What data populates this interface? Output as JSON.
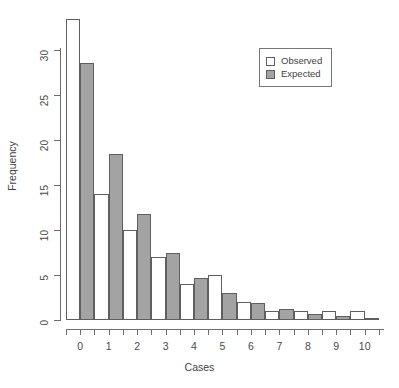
{
  "chart_data": {
    "type": "bar",
    "title": "",
    "xlabel": "Cases",
    "ylabel": "Frequency",
    "categories": [
      "0",
      "1",
      "2",
      "3",
      "4",
      "5",
      "6",
      "7",
      "8",
      "9",
      "10"
    ],
    "series": [
      {
        "name": "Observed",
        "fill": "#ffffff",
        "values": [
          33.5,
          14,
          10,
          7,
          4,
          5,
          2,
          1,
          1,
          1,
          1
        ]
      },
      {
        "name": "Expected",
        "fill": "#a3a3a3",
        "values": [
          28.6,
          18.4,
          11.8,
          7.4,
          4.7,
          3.0,
          1.9,
          1.2,
          0.7,
          0.4,
          0.2
        ]
      }
    ],
    "ylim": [
      0,
      33.5
    ],
    "yticks": [
      0,
      5,
      10,
      15,
      20,
      25,
      30
    ],
    "ytick_labels": [
      "0",
      "5",
      "10",
      "15",
      "20",
      "25",
      "30"
    ],
    "xticks": [
      "0",
      "1",
      "2",
      "3",
      "4",
      "5",
      "6",
      "7",
      "8",
      "9",
      "10"
    ],
    "grid": false,
    "legend_position": "top-right",
    "legend_entries": [
      "Observed",
      "Expected"
    ]
  },
  "axes": {
    "y_title": "Frequency",
    "x_title": "Cases"
  },
  "legend": {
    "observed_label": "Observed",
    "expected_label": "Expected"
  }
}
